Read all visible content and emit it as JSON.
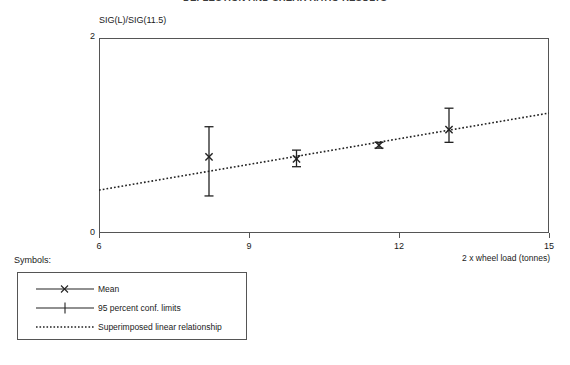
{
  "chart_data": {
    "type": "scatter",
    "title": "DEFLECTION AND SHEAR RATIO RESULTS",
    "xlabel": "2 x wheel load (tonnes)",
    "ylabel": "SIG(L)/SIG(11.5)",
    "xlim": [
      6,
      15
    ],
    "ylim": [
      0,
      2
    ],
    "xticks": [
      "6",
      "9",
      "12",
      "15"
    ],
    "xtick_values": [
      6,
      9,
      12,
      15
    ],
    "yticks": [
      "0",
      "2"
    ],
    "ytick_values": [
      0,
      2
    ],
    "grid": false,
    "legend_position": "below-left",
    "series": [
      {
        "name": "Mean",
        "marker": "x",
        "points": [
          {
            "x": 8.2,
            "y": 0.78
          },
          {
            "x": 9.95,
            "y": 0.76
          },
          {
            "x": 11.6,
            "y": 0.9
          },
          {
            "x": 13.0,
            "y": 1.06
          }
        ]
      },
      {
        "name": "95 percent conf. limits",
        "marker": "plus",
        "error_bars": [
          {
            "x": 8.2,
            "low": 0.38,
            "high": 1.09
          },
          {
            "x": 9.95,
            "low": 0.68,
            "high": 0.85
          },
          {
            "x": 11.6,
            "low": 0.87,
            "high": 0.93
          },
          {
            "x": 13.0,
            "low": 0.93,
            "high": 1.28
          }
        ]
      },
      {
        "name": "Superimposed linear relationship",
        "marker": "dotted-line",
        "line": {
          "x1": 6,
          "y1": 0.44,
          "x2": 15,
          "y2": 1.23
        }
      }
    ]
  },
  "axes": {
    "y_title": "SIG(L)/SIG(11.5)",
    "x_title": "2 x wheel load (tonnes)",
    "y_top_label": "2",
    "y_bottom_label": "0",
    "x_labels": [
      "6",
      "9",
      "12",
      "15"
    ]
  },
  "legend": {
    "caption": "Symbols:",
    "items": [
      {
        "label": "Mean",
        "symbol": "mean-marker"
      },
      {
        "label": "95 percent conf. limits",
        "symbol": "conf-limit-marker"
      },
      {
        "label": "Superimposed linear relationship",
        "symbol": "dotted-line"
      }
    ]
  },
  "colors": {
    "ink": "#1a1a1a",
    "frame": "#555555",
    "plot_line": "#222222"
  }
}
